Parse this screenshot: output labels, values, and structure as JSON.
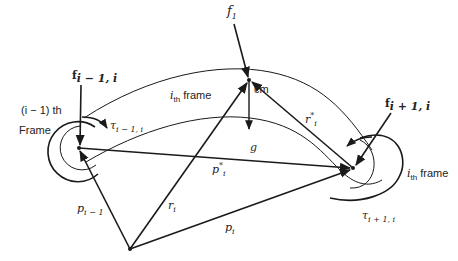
{
  "diagram": {
    "labels": {
      "f1": {
        "main": "f",
        "sub": "1"
      },
      "f_im1_i": {
        "main": "f",
        "sub": "i − 1, i"
      },
      "f_ip1_i": {
        "main": "f",
        "sub": "i + 1, i"
      },
      "cm": "cm",
      "g": "g",
      "r_star": {
        "main": "r",
        "sup": "*",
        "sub": "i"
      },
      "p_star": {
        "main": "p",
        "sup": "*",
        "sub": "i"
      },
      "r_i": {
        "main": "r",
        "sub": "i"
      },
      "p_i": {
        "main": "p",
        "sub": "i"
      },
      "p_im1": {
        "main": "p",
        "sub": "i − 1"
      },
      "tau_im1_i": {
        "main": "τ",
        "sub": "i − 1, i"
      },
      "tau_ip1_i": {
        "main": "τ",
        "sub": "i + 1, i"
      },
      "frame_im1_line1": "(i − 1) th",
      "frame_im1_line2": "Frame",
      "ith_frame_top": {
        "main": "i",
        "sub": "th",
        "rest": " frame"
      },
      "ith_frame_right": {
        "main": "i",
        "sub": "th",
        "rest": " frame"
      }
    },
    "points": {
      "origin": [
        130,
        249
      ],
      "joint_left": [
        79,
        148
      ],
      "center_of_mass": [
        249,
        80
      ],
      "joint_right": [
        353,
        168
      ]
    },
    "stroke_color": "#1a1a1a"
  }
}
